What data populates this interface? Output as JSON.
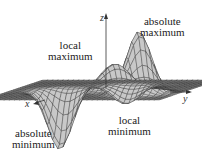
{
  "figure": {
    "type": "3d-surface",
    "axes": {
      "x": "x",
      "y": "y",
      "z": "z"
    },
    "labels": {
      "absolute_maximum": [
        "absolute",
        "maximum"
      ],
      "local_maximum": [
        "local",
        "maximum"
      ],
      "local_minimum": [
        "local",
        "minimum"
      ],
      "absolute_minimum": [
        "absolute",
        "minimum"
      ]
    }
  },
  "colors": {
    "mesh": "#2a2a2a",
    "surface": "#b8b8b8",
    "background": "#ffffff"
  }
}
